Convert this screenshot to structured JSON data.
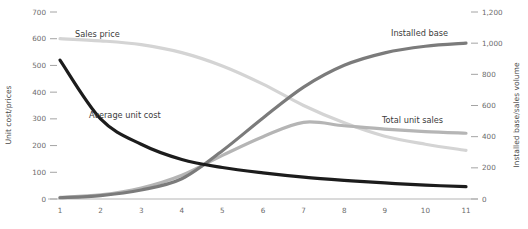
{
  "chart_data": {
    "type": "line",
    "title": "",
    "xlabel": "",
    "ylabel": "Unit cost/prices",
    "y2label": "Installed base/sales volume",
    "x": [
      1,
      2,
      3,
      4,
      5,
      6,
      7,
      8,
      9,
      10,
      11
    ],
    "xtick_labels": [
      "1",
      "2",
      "3",
      "4",
      "5",
      "6",
      "7",
      "8",
      "9",
      "10",
      "11"
    ],
    "ylim": [
      0,
      700
    ],
    "ytick_labels": [
      "0",
      "100",
      "200",
      "300",
      "400",
      "500",
      "600",
      "700"
    ],
    "ytick_values": [
      0,
      100,
      200,
      300,
      400,
      500,
      600,
      700
    ],
    "y2lim": [
      0,
      1200
    ],
    "y2tick_labels": [
      "0",
      "200",
      "400",
      "600",
      "800",
      "1,000",
      "1,200"
    ],
    "y2tick_values": [
      0,
      200,
      400,
      600,
      800,
      1000,
      1200
    ],
    "grid": false,
    "legend_position": "inline-annotations",
    "series": [
      {
        "name": "Sales price",
        "axis": "left",
        "color": "#d4d4d4",
        "width": 3.2,
        "values": [
          600,
          592,
          578,
          548,
          498,
          430,
          350,
          285,
          235,
          205,
          182
        ]
      },
      {
        "name": "Average unit cost",
        "axis": "left",
        "color": "#1c1c1c",
        "width": 3.2,
        "values": [
          520,
          300,
          205,
          148,
          118,
          98,
          82,
          70,
          60,
          52,
          46
        ]
      },
      {
        "name": "Installed base",
        "axis": "right",
        "color": "#7b7b7b",
        "width": 3.2,
        "values": [
          8,
          22,
          58,
          130,
          310,
          520,
          718,
          858,
          938,
          980,
          1000
        ]
      },
      {
        "name": "Total unit sales",
        "axis": "right",
        "color": "#b5b5b5",
        "width": 3.2,
        "values": [
          10,
          26,
          70,
          152,
          280,
          400,
          492,
          470,
          448,
          432,
          422
        ]
      }
    ],
    "annotations": [
      {
        "text": "Sales price",
        "x_px": 75,
        "y_px": 37
      },
      {
        "text": "Average unit cost",
        "x_px": 89,
        "y_px": 118
      },
      {
        "text": "Installed base",
        "x_px": 391,
        "y_px": 36
      },
      {
        "text": "Total unit sales",
        "x_px": 382,
        "y_px": 123
      }
    ]
  }
}
